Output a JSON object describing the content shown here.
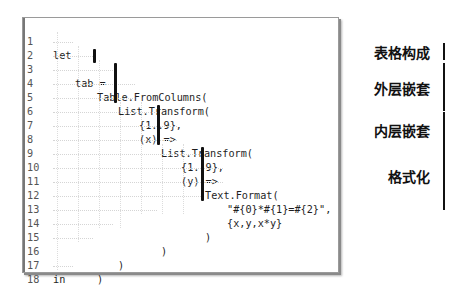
{
  "editor": {
    "lines": [
      {
        "n": "1",
        "text": "let"
      },
      {
        "n": "2",
        "text": "tab ="
      },
      {
        "n": "3",
        "text": "Table.FromColumns("
      },
      {
        "n": "4",
        "text": "List.Transform("
      },
      {
        "n": "5",
        "text": "{1..9},"
      },
      {
        "n": "6",
        "text": "(x) =>"
      },
      {
        "n": "7",
        "text": "List.Transform("
      },
      {
        "n": "8",
        "text": "{1..9},"
      },
      {
        "n": "9",
        "text": "(y) =>"
      },
      {
        "n": "10",
        "text": "Text.Format("
      },
      {
        "n": "11",
        "text": "\"#{0}*#{1}=#{2}\","
      },
      {
        "n": "12",
        "text": "{x,y,x*y}"
      },
      {
        "n": "13",
        "text": ")"
      },
      {
        "n": "14",
        "text": ")"
      },
      {
        "n": "15",
        "text": ")"
      },
      {
        "n": "16",
        "text": ")"
      },
      {
        "n": "17",
        "text": "in"
      },
      {
        "n": "18",
        "text": "tab"
      }
    ]
  },
  "annotations": {
    "table_construct": "表格构成",
    "outer_nesting": "外层嵌套",
    "inner_nesting": "内层嵌套",
    "formatting": "格式化"
  },
  "colors": {
    "highlight_bar": "#111111",
    "line_number": "#555555",
    "code_text": "#1e1e1e",
    "border": "#9a9a9a"
  }
}
